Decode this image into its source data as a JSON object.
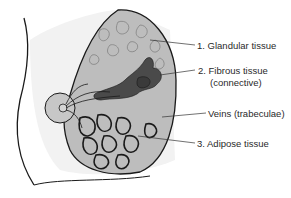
{
  "diagram": {
    "labels": [
      {
        "id": "glandular",
        "text": "1. Glandular tissue",
        "x": 197,
        "y": 40
      },
      {
        "id": "fibrous",
        "text": "2. Fibrous tissue",
        "x": 198,
        "y": 65
      },
      {
        "id": "fibrous_sub",
        "text": "(connective)",
        "x": 210,
        "y": 77
      },
      {
        "id": "veins",
        "text": "Veins (trabeculae)",
        "x": 208,
        "y": 108
      },
      {
        "id": "adipose",
        "text": "3. Adipose tissue",
        "x": 197,
        "y": 138
      }
    ],
    "colors": {
      "tissue": "#b9b9b9",
      "outline": "#1a1a1a",
      "dark": "#4a4a4a",
      "skin": "#f2f2f2"
    }
  }
}
